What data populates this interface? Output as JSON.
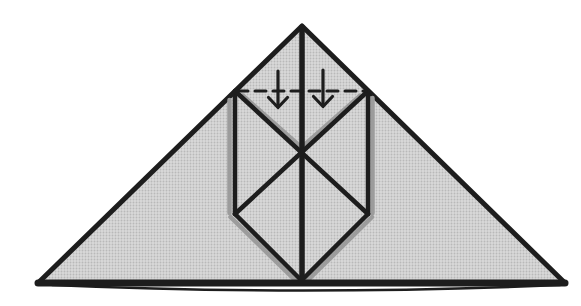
{
  "diagram": {
    "type": "origami-fold-step",
    "canvas": {
      "width": 581,
      "height": 306
    },
    "palette": {
      "background": "#ffffff",
      "paper_base": "#d9d9d9",
      "paper_dot": "#b9b9b9",
      "line": "#1d1d1d",
      "shadow": "#9c9c9c"
    },
    "shapes": [
      {
        "name": "paper-face",
        "kind": "polygon",
        "points": "302,26 38,283 565,283",
        "fill": "paper",
        "stroke": "line",
        "w": 5
      },
      {
        "name": "shadow-left-pocket-edge",
        "kind": "line",
        "x1": 229.5,
        "y1": 100,
        "x2": 229.5,
        "y2": 213,
        "stroke": "shadow",
        "w": 4.5
      },
      {
        "name": "shadow-right-pocket-edge",
        "kind": "line",
        "x1": 372.5,
        "y1": 98,
        "x2": 372.5,
        "y2": 213,
        "stroke": "shadow",
        "w": 4.5
      },
      {
        "name": "shadow-under-left-flap",
        "kind": "line",
        "x1": 243,
        "y1": 96,
        "x2": 303,
        "y2": 149,
        "stroke": "shadow",
        "w": 5
      },
      {
        "name": "shadow-under-right-flap",
        "kind": "line",
        "x1": 360,
        "y1": 96,
        "x2": 300,
        "y2": 149,
        "stroke": "shadow",
        "w": 5
      },
      {
        "name": "shadow-bottom-left-edge",
        "kind": "line",
        "x1": 230.5,
        "y1": 217,
        "x2": 297,
        "y2": 282,
        "stroke": "shadow",
        "w": 4.5
      },
      {
        "name": "shadow-bottom-right-edge",
        "kind": "line",
        "x1": 372,
        "y1": 217,
        "x2": 306,
        "y2": 282,
        "stroke": "shadow",
        "w": 4.5
      },
      {
        "name": "center-crease",
        "kind": "line",
        "x1": 302,
        "y1": 27,
        "x2": 302,
        "y2": 282,
        "stroke": "line",
        "w": 5.5
      },
      {
        "name": "left-pocket-edge",
        "kind": "line",
        "x1": 235,
        "y1": 91,
        "x2": 235,
        "y2": 214,
        "stroke": "line",
        "w": 4.5
      },
      {
        "name": "right-pocket-edge",
        "kind": "line",
        "x1": 368,
        "y1": 91,
        "x2": 368,
        "y2": 214,
        "stroke": "line",
        "w": 4.5
      },
      {
        "name": "diagonal-crease-left",
        "kind": "line",
        "x1": 235,
        "y1": 91,
        "x2": 368,
        "y2": 214,
        "stroke": "line",
        "w": 4.5
      },
      {
        "name": "diagonal-crease-right",
        "kind": "line",
        "x1": 368,
        "y1": 91,
        "x2": 235,
        "y2": 214,
        "stroke": "line",
        "w": 4.5
      },
      {
        "name": "pocket-bottom-left-edge",
        "kind": "line",
        "x1": 235,
        "y1": 214,
        "x2": 301.5,
        "y2": 280.5,
        "stroke": "line",
        "w": 4.5
      },
      {
        "name": "pocket-bottom-right-edge",
        "kind": "line",
        "x1": 368,
        "y1": 214,
        "x2": 301.5,
        "y2": 280.5,
        "stroke": "line",
        "w": 4.5
      },
      {
        "name": "base-edge",
        "kind": "line",
        "x1": 38,
        "y1": 283,
        "x2": 565,
        "y2": 283,
        "stroke": "line",
        "w": 7
      },
      {
        "name": "base-under-edge",
        "kind": "path",
        "d": "M 52 285 Q 300 296 560 285",
        "stroke": "line",
        "w": 2.5,
        "fill": "none"
      },
      {
        "name": "valley-fold-line",
        "kind": "line",
        "x1": 237,
        "y1": 91,
        "x2": 366,
        "y2": 91,
        "stroke": "line",
        "w": 3,
        "dash": "11 7"
      },
      {
        "name": "fold-arrow-left-shaft",
        "kind": "line",
        "x1": 278,
        "y1": 71,
        "x2": 278,
        "y2": 104,
        "stroke": "line",
        "w": 3.2
      },
      {
        "name": "fold-arrow-left-head",
        "kind": "polyline",
        "points": "268.5,97.5 278,107.5 287.5,97.5",
        "stroke": "line",
        "w": 3.2,
        "fill": "none"
      },
      {
        "name": "fold-arrow-right-shaft",
        "kind": "line",
        "x1": 323,
        "y1": 70,
        "x2": 323,
        "y2": 103,
        "stroke": "line",
        "w": 3.2
      },
      {
        "name": "fold-arrow-right-head",
        "kind": "polyline",
        "points": "313.5,96.5 323,106.5 332.5,96.5",
        "stroke": "line",
        "w": 3.2,
        "fill": "none"
      }
    ]
  }
}
